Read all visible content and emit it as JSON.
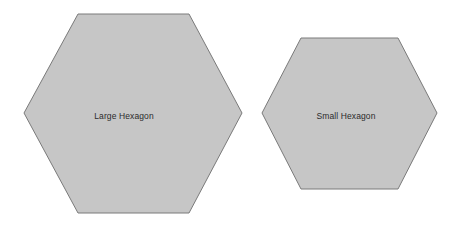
{
  "canvas": {
    "width": 458,
    "height": 226,
    "background_color": "#ffffff"
  },
  "style": {
    "shape_fill": "#c6c6c6",
    "shape_stroke": "#7a7a7a",
    "shape_stroke_width": 1,
    "label_color": "#2b2b2b",
    "label_font_size": "8.5px"
  },
  "shapes": [
    {
      "id": "large-hexagon",
      "type": "hexagon",
      "label": "Large Hexagon",
      "orientation": "pointy-left-right",
      "center": {
        "x": 133,
        "y": 113
      },
      "width": 218,
      "height": 199,
      "vertices": [
        {
          "x": 24,
          "y": 113
        },
        {
          "x": 78,
          "y": 14
        },
        {
          "x": 189,
          "y": 14
        },
        {
          "x": 242,
          "y": 113
        },
        {
          "x": 189,
          "y": 213
        },
        {
          "x": 78,
          "y": 213
        }
      ],
      "points_attr": "24,113 78,14 189,14 242,113 189,213 78,213",
      "fill": "#c6c6c6",
      "stroke": "#7a7a7a",
      "label_position": {
        "x": 124,
        "y": 116
      }
    },
    {
      "id": "small-hexagon",
      "type": "hexagon",
      "label": "Small Hexagon",
      "orientation": "pointy-left-right",
      "center": {
        "x": 349.5,
        "y": 113
      },
      "width": 175,
      "height": 151,
      "vertices": [
        {
          "x": 262,
          "y": 113
        },
        {
          "x": 301,
          "y": 38
        },
        {
          "x": 398,
          "y": 38
        },
        {
          "x": 437,
          "y": 113
        },
        {
          "x": 398,
          "y": 189
        },
        {
          "x": 301,
          "y": 189
        }
      ],
      "points_attr": "262,113 301,38 398,38 437,113 398,189 301,189",
      "fill": "#c6c6c6",
      "stroke": "#7a7a7a",
      "label_position": {
        "x": 346,
        "y": 116
      }
    }
  ]
}
